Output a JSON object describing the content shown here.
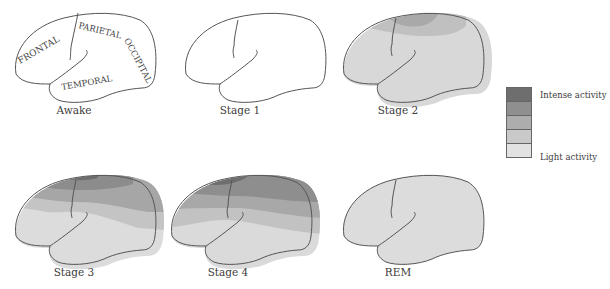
{
  "panels": [
    {
      "id": "awake",
      "caption": "Awake",
      "lobes": [
        "FRONTAL",
        "PARIETAL",
        "OCCIPITAL",
        "TEMPORAL"
      ]
    },
    {
      "id": "stage1",
      "caption": "Stage 1"
    },
    {
      "id": "stage2",
      "caption": "Stage 2"
    },
    {
      "id": "stage3",
      "caption": "Stage 3"
    },
    {
      "id": "stage4",
      "caption": "Stage 4"
    },
    {
      "id": "rem",
      "caption": "REM"
    }
  ],
  "legend": {
    "top_label": "Intense activity",
    "bottom_label": "Light activity",
    "colors": [
      "#6e6e6e",
      "#8f8f8f",
      "#adadad",
      "#c9c9c9",
      "#e2e2e2"
    ]
  },
  "colors": {
    "outline": "#555555",
    "level1": "#6e6e6e",
    "level2": "#8f8f8f",
    "level3": "#adadad",
    "level4": "#c9c9c9",
    "level5": "#e2e2e2"
  }
}
